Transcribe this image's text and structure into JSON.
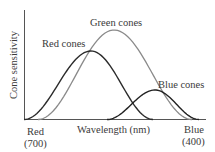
{
  "chart_data": {
    "type": "line",
    "title": "",
    "xlabel": "Wavelength (nm)",
    "ylabel": "Cone sensitivity",
    "x_left_label": "Red",
    "x_left_value": "(700)",
    "x_right_label": "Blue",
    "x_right_value": "(400)",
    "xlim": [
      700,
      400
    ],
    "grid": false,
    "legend": "inline curve labels",
    "series": [
      {
        "name": "Red cones",
        "color": "#2b2b2b",
        "start_x": 24,
        "peak_x": 91,
        "peak_y": 51,
        "end_x": 153,
        "relative_peak": 0.77
      },
      {
        "name": "Green cones",
        "color": "#8a8a8a",
        "start_x": 38,
        "peak_x": 114,
        "peak_y": 30,
        "end_x": 192,
        "relative_peak": 1.0
      },
      {
        "name": "Blue cones",
        "color": "#222222",
        "start_x": 107,
        "peak_x": 155,
        "peak_y": 90,
        "end_x": 199,
        "relative_peak": 0.33
      }
    ]
  },
  "labels": {
    "red_cones": "Red cones",
    "green_cones": "Green cones",
    "blue_cones": "Blue cones",
    "y_axis": "Cone sensitivity",
    "x_axis": "Wavelength (nm)",
    "left_end": "Red",
    "left_end_value": "(700)",
    "right_end": "Blue",
    "right_end_value": "(400)"
  }
}
